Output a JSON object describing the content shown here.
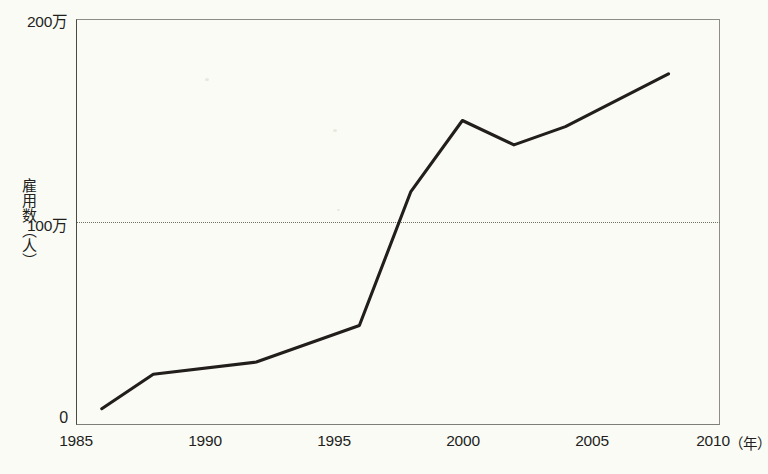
{
  "chart_data": {
    "type": "line",
    "title": "",
    "xlabel": "年",
    "ylabel": "雇用数（人）",
    "xlim": [
      1985,
      2010
    ],
    "ylim": [
      0,
      2000000
    ],
    "grid": "horizontal dotted line at 1,000,000",
    "legend": "none",
    "x_tick_labels": [
      "1985",
      "1990",
      "1995",
      "2000",
      "2005",
      "2010"
    ],
    "x_tick_values": [
      1985,
      1990,
      1995,
      2000,
      2005,
      2010
    ],
    "y_tick_labels": [
      "0",
      "100万",
      "200万"
    ],
    "y_tick_values": [
      0,
      1000000,
      2000000
    ],
    "x_unit_label": "（年）",
    "series": [
      {
        "name": "雇用数",
        "x": [
          1986,
          1988,
          1992,
          1996,
          1998,
          2000,
          2002,
          2004,
          2008
        ],
        "values": [
          80000,
          250000,
          310000,
          490000,
          1150000,
          1500000,
          1380000,
          1470000,
          1730000
        ],
        "values_in_man": [
          8,
          25,
          31,
          49,
          115,
          150,
          138,
          147,
          173
        ]
      }
    ]
  },
  "axis": {
    "y_top_label": "200万",
    "y_mid_label": "100万",
    "y_zero_label": "0",
    "y_title": "雇用数（人）",
    "x_labels": {
      "t1985": "1985",
      "t1990": "1990",
      "t1995": "1995",
      "t2000": "2000",
      "t2005": "2005",
      "t2010": "2010"
    },
    "x_unit": "（年）"
  },
  "colors": {
    "background": "#fbfbf6",
    "line": "#211e1b",
    "frame": "#8d8d85",
    "grid": "#6f6f62",
    "text": "#221f1c"
  }
}
